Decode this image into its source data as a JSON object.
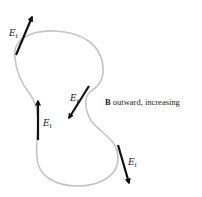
{
  "diagram": {
    "caption_symbol": "B",
    "caption_text": " outward, increasing",
    "colors": {
      "curve": "#c4c4c4",
      "arrow": "#111111",
      "text": "#222222",
      "background": "#ffffff"
    },
    "vectors": [
      {
        "id": "top-left",
        "label": "E",
        "subscript": "t"
      },
      {
        "id": "middle-left",
        "label": "E",
        "subscript": "t"
      },
      {
        "id": "middle-center",
        "label": "E",
        "subscript": "t"
      },
      {
        "id": "bottom-right",
        "label": "E",
        "subscript": "t"
      }
    ]
  }
}
